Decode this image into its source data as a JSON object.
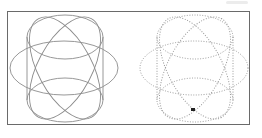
{
  "diagram": {
    "colors": {
      "frame": "#6a6a6a",
      "stroke": "#8c8c8c",
      "marker": "#222222",
      "background": "#ffffff"
    },
    "figures": [
      {
        "id": "left",
        "style": "solid",
        "cx": 64,
        "cy": 68
      },
      {
        "id": "right",
        "style": "dotted",
        "cx": 194,
        "cy": 68,
        "marker": {
          "x": 193,
          "y": 110
        }
      }
    ]
  }
}
